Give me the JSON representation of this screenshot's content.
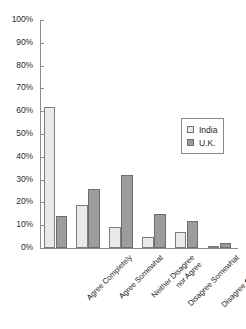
{
  "chart_data": {
    "type": "bar",
    "title": "",
    "xlabel": "",
    "ylabel": "",
    "ylim": [
      0,
      100
    ],
    "yticks": [
      "0%",
      "10%",
      "20%",
      "30%",
      "40%",
      "50%",
      "60%",
      "70%",
      "80%",
      "90%",
      "100%"
    ],
    "ytick_values": [
      0,
      10,
      20,
      30,
      40,
      50,
      60,
      70,
      80,
      90,
      100
    ],
    "grid": false,
    "legend_position": "upper right",
    "categories": [
      "Agree Completely",
      "Agree Somewhat",
      "Neither Disagree nor Agree",
      "Disagree Somewhat",
      "Disagree Completely",
      "Don't Know"
    ],
    "category_lines": [
      [
        "Agree Completely"
      ],
      [
        "Agree Somewhat"
      ],
      [
        "Neither Disagree",
        "nor Agree"
      ],
      [
        "Disagree Somewhat"
      ],
      [
        "Disagree Completely"
      ],
      [
        "Don't Know"
      ]
    ],
    "series": [
      {
        "name": "India",
        "color": "#e9e9e6",
        "values": [
          62,
          19,
          9,
          5,
          7,
          1
        ]
      },
      {
        "name": "U.K.",
        "color": "#9c9c9c",
        "values": [
          14,
          26,
          32,
          15,
          12,
          2
        ]
      }
    ]
  },
  "legend": {
    "items": [
      {
        "label": "India"
      },
      {
        "label": "U.K."
      }
    ]
  }
}
